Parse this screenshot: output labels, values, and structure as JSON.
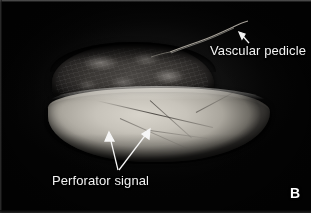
{
  "figure": {
    "panel_letter": "B",
    "background_color": "#050505",
    "annotation_color": "#f2f2f2"
  },
  "annotations": [
    {
      "id": "vascular-pedicle",
      "label": "Vascular pedicle",
      "arrow": "up-left-arrow",
      "arrow_count": 1
    },
    {
      "id": "perforator-signal",
      "label": "Perforator signal",
      "arrow": "double-arrow-up",
      "arrow_count": 2
    }
  ],
  "specimen": {
    "muscle_color": "#3a3734",
    "flap_color": "#c7c3ba",
    "pedicle_color": "#cfcabf"
  }
}
